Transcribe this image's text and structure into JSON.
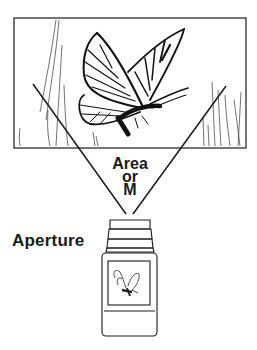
{
  "diagram": {
    "labels": {
      "area_line1": "Area",
      "area_line2": "or",
      "area_line3": "M",
      "aperture": "Aperture"
    },
    "elements": {
      "scene_frame": "scene-frame",
      "subject": "butterfly",
      "viewing_cone": "field-of-view-lines",
      "camera": "camera-body"
    },
    "colors": {
      "ink": "#1a1a1a",
      "background": "#ffffff"
    }
  }
}
